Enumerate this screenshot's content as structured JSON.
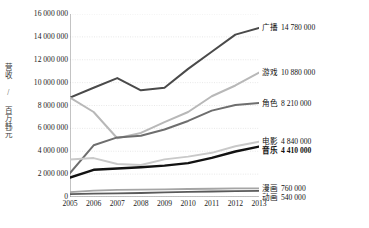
{
  "chart_data": {
    "type": "line",
    "title": "",
    "xlabel": "",
    "ylabel": "营收 / 百万韩元",
    "categories": [
      "2005",
      "2006",
      "2007",
      "2008",
      "2009",
      "2010",
      "2011",
      "2012",
      "2013"
    ],
    "ylim": [
      0,
      16000000
    ],
    "yticks": [
      16000000,
      14000000,
      12000000,
      10000000,
      8000000,
      6000000,
      4000000,
      2000000,
      0
    ],
    "ytick_labels": [
      "16 000 000",
      "14 000 000",
      "12 000 000",
      "10 000 000",
      "8 000 000",
      "6 000 000",
      "4 000 000",
      "2 000 000",
      "0"
    ],
    "grid": true,
    "legend_position": "right-end-labels",
    "series": [
      {
        "name": "广播",
        "end_value_label": "14 780 000",
        "end_value": 14780000,
        "color": "#4a4a4a",
        "width": 2.0,
        "bold_label": false,
        "values": [
          8700000,
          9550000,
          10400000,
          9330000,
          9560000,
          11200000,
          12700000,
          14200000,
          14780000
        ]
      },
      {
        "name": "游戏",
        "end_value_label": "10 880 000",
        "end_value": 10880000,
        "color": "#b8b8b8",
        "width": 2.0,
        "bold_label": false,
        "values": [
          8700000,
          7430000,
          5140000,
          5600000,
          6550000,
          7430000,
          8810000,
          9750000,
          10880000
        ]
      },
      {
        "name": "角色",
        "end_value_label": "8 210 000",
        "end_value": 8210000,
        "color": "#6e6e6e",
        "width": 2.0,
        "bold_label": false,
        "values": [
          2100000,
          4520000,
          5210000,
          5350000,
          5900000,
          6650000,
          7550000,
          8050000,
          8210000
        ]
      },
      {
        "name": "电影",
        "end_value_label": "4 840 000",
        "end_value": 4840000,
        "color": "#c9c9c9",
        "width": 2.0,
        "bold_label": false,
        "values": [
          3270000,
          3400000,
          2880000,
          2800000,
          3290000,
          3530000,
          3860000,
          4440000,
          4840000
        ]
      },
      {
        "name": "音乐",
        "end_value_label": "4 410 000",
        "end_value": 4410000,
        "color": "#121212",
        "width": 2.4,
        "bold_label": true,
        "values": [
          1700000,
          2380000,
          2490000,
          2600000,
          2740000,
          2960000,
          3420000,
          3980000,
          4410000
        ]
      },
      {
        "name": "漫画",
        "end_value_label": "760 000",
        "end_value": 760000,
        "color": "#a5a5a5",
        "width": 1.8,
        "bold_label": false,
        "values": [
          430000,
          560000,
          620000,
          640000,
          670000,
          700000,
          720000,
          750000,
          760000
        ]
      },
      {
        "name": "动画",
        "end_value_label": "540 000",
        "end_value": 540000,
        "color": "#5a5a5a",
        "width": 1.8,
        "bold_label": false,
        "values": [
          250000,
          290000,
          320000,
          350000,
          400000,
          440000,
          480000,
          510000,
          540000
        ]
      }
    ]
  }
}
